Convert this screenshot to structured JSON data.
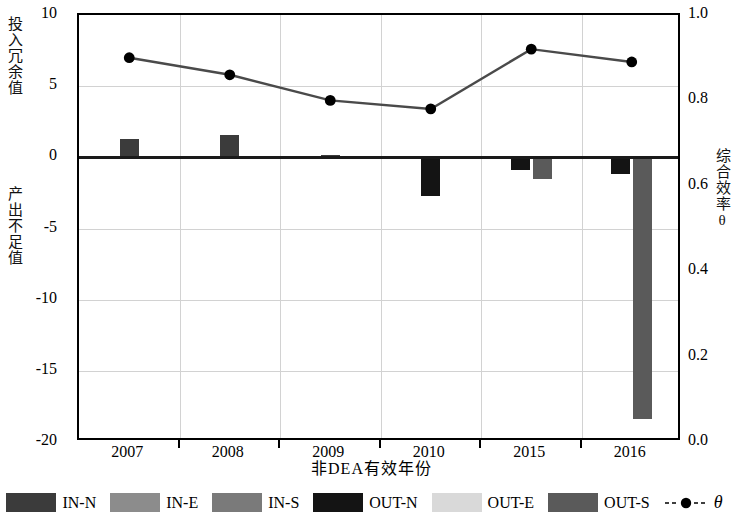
{
  "chart_data": {
    "type": "bar",
    "title": "",
    "subtitle": "",
    "xlabel": "非DEA有效年份",
    "ylabel": "投入冗余值",
    "ylabel2": "产出不足值",
    "ylabel_right": "综合效率θ",
    "categories": [
      "2007",
      "2008",
      "2009",
      "2010",
      "2015",
      "2016"
    ],
    "ylim": [
      -20,
      10
    ],
    "ylim_right": [
      0.0,
      1.0
    ],
    "yticks": [
      "10",
      "5",
      "0",
      "-5",
      "-10",
      "-15",
      "-20"
    ],
    "ytick_values": [
      10,
      5,
      0,
      -5,
      -10,
      -15,
      -20
    ],
    "yticks_right": [
      "1.0",
      "0.8",
      "0.6",
      "0.4",
      "0.2",
      "0.0"
    ],
    "ytick_values_right": [
      1.0,
      0.8,
      0.6,
      0.4,
      0.2,
      0.0
    ],
    "grid": true,
    "legend_position": "bottom",
    "series": [
      {
        "name": "IN-N",
        "color": "#3b3b3b",
        "values": [
          1.3,
          1.6,
          0.15,
          0,
          0,
          0
        ]
      },
      {
        "name": "IN-E",
        "color": "#8c8c8c",
        "values": [
          0,
          0,
          0,
          0,
          0,
          0
        ]
      },
      {
        "name": "IN-S",
        "color": "#7a7a7a",
        "values": [
          0,
          0,
          0,
          0,
          0,
          0
        ]
      },
      {
        "name": "OUT-N",
        "color": "#141414",
        "values": [
          0,
          0,
          0,
          -2.7,
          -0.9,
          -1.2
        ]
      },
      {
        "name": "OUT-E",
        "color": "#d9d9d9",
        "values": [
          0,
          0,
          0,
          0,
          0,
          0
        ]
      },
      {
        "name": "OUT-S",
        "color": "#5a5a5a",
        "values": [
          0,
          0,
          0,
          0,
          -1.5,
          -18.4
        ]
      }
    ],
    "line_series": {
      "name": "θ",
      "color": "#4a4a4a",
      "marker_color": "#000000",
      "axis": "right",
      "values": [
        0.9,
        0.86,
        0.8,
        0.78,
        0.92,
        0.89
      ]
    }
  },
  "legend": {
    "items": [
      {
        "label": "IN-N",
        "color": "#3b3b3b",
        "type": "swatch"
      },
      {
        "label": "IN-E",
        "color": "#8c8c8c",
        "type": "swatch"
      },
      {
        "label": "IN-S",
        "color": "#7a7a7a",
        "type": "swatch"
      },
      {
        "label": "OUT-N",
        "color": "#141414",
        "type": "swatch"
      },
      {
        "label": "OUT-E",
        "color": "#d9d9d9",
        "type": "swatch"
      },
      {
        "label": "OUT-S",
        "color": "#5a5a5a",
        "type": "swatch"
      },
      {
        "label": "θ",
        "color": "#000000",
        "type": "line-marker"
      }
    ]
  }
}
